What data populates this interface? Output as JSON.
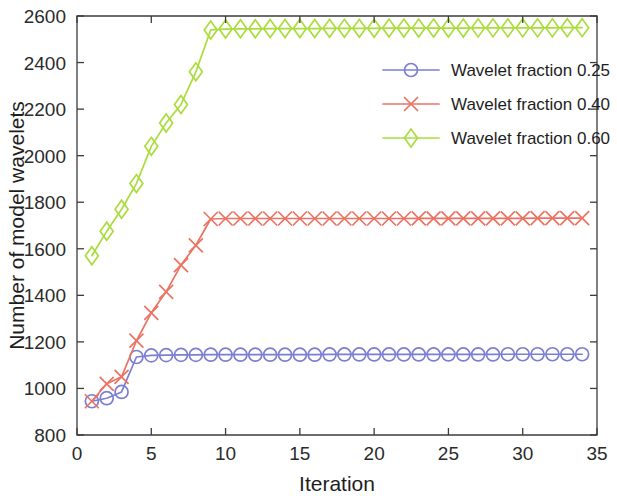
{
  "chart_data": {
    "type": "line",
    "title": "",
    "xlabel": "Iteration",
    "ylabel": "Number of model wavelets",
    "xlim": [
      0,
      35
    ],
    "ylim": [
      800,
      2600
    ],
    "xticks": [
      0,
      5,
      10,
      15,
      20,
      25,
      30,
      35
    ],
    "yticks": [
      800,
      1000,
      1200,
      1400,
      1600,
      1800,
      2000,
      2200,
      2400,
      2600
    ],
    "grid": false,
    "legend_position": "upper right",
    "x": [
      1,
      2,
      3,
      4,
      5,
      6,
      7,
      8,
      9,
      10,
      11,
      12,
      13,
      14,
      15,
      16,
      17,
      18,
      19,
      20,
      21,
      22,
      23,
      24,
      25,
      26,
      27,
      28,
      29,
      30,
      31,
      32,
      33,
      34
    ],
    "series": [
      {
        "name": "Wavelet fraction 0.25",
        "color": "#7b7fd4",
        "marker": "circle",
        "values": [
          945,
          958,
          985,
          1135,
          1142,
          1143,
          1144,
          1144,
          1145,
          1145,
          1145,
          1145,
          1145,
          1145,
          1145,
          1145,
          1146,
          1146,
          1146,
          1146,
          1146,
          1146,
          1146,
          1146,
          1146,
          1146,
          1146,
          1146,
          1147,
          1147,
          1147,
          1147,
          1147,
          1147
        ]
      },
      {
        "name": "Wavelet fraction 0.40",
        "color": "#eb7363",
        "marker": "cross",
        "values": [
          945,
          1020,
          1050,
          1205,
          1325,
          1415,
          1530,
          1615,
          1728,
          1730,
          1730,
          1730,
          1730,
          1730,
          1730,
          1730,
          1730,
          1730,
          1730,
          1730,
          1730,
          1730,
          1731,
          1731,
          1731,
          1731,
          1731,
          1731,
          1731,
          1731,
          1732,
          1732,
          1732,
          1732
        ]
      },
      {
        "name": "Wavelet fraction 0.60",
        "color": "#aadd3c",
        "marker": "diamond",
        "values": [
          1570,
          1675,
          1770,
          1880,
          2040,
          2140,
          2220,
          2360,
          2540,
          2544,
          2545,
          2545,
          2546,
          2546,
          2546,
          2546,
          2547,
          2547,
          2547,
          2547,
          2548,
          2548,
          2548,
          2548,
          2548,
          2548,
          2549,
          2549,
          2549,
          2549,
          2549,
          2549,
          2550,
          2550
        ]
      }
    ]
  },
  "legend": {
    "entries": [
      {
        "label": "Wavelet fraction 0.25"
      },
      {
        "label": "Wavelet fraction 0.40"
      },
      {
        "label": "Wavelet fraction 0.60"
      }
    ]
  }
}
